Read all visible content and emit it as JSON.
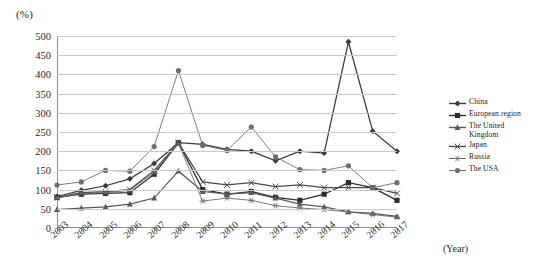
{
  "chart_data": {
    "type": "line",
    "title": "",
    "xlabel": "(Year)",
    "ylabel": "(%)",
    "ylim": [
      0,
      500
    ],
    "ytick_step": 50,
    "grid": true,
    "legend_position": "right",
    "categories": [
      "2003",
      "2004",
      "2005",
      "2006",
      "2007",
      "2008",
      "2009",
      "2010",
      "2011",
      "2012",
      "2013",
      "2014",
      "2015",
      "2016",
      "2017"
    ],
    "yticks": [
      "0",
      "50",
      "100",
      "150",
      "200",
      "250",
      "300",
      "350",
      "400",
      "450",
      "500"
    ],
    "series": [
      {
        "name": "China",
        "marker": "diamond",
        "color": "#3a3a3a",
        "values": [
          82,
          98,
          110,
          128,
          168,
          222,
          218,
          205,
          200,
          175,
          200,
          195,
          485,
          252,
          200
        ]
      },
      {
        "name": "European region",
        "marker": "square",
        "color": "#2e2e2e",
        "values": [
          80,
          88,
          90,
          92,
          140,
          222,
          100,
          88,
          95,
          80,
          72,
          88,
          118,
          105,
          72
        ]
      },
      {
        "name": "The United Kingdom",
        "marker": "triangle",
        "color": "#5a5a5a",
        "values": [
          48,
          52,
          55,
          62,
          78,
          148,
          95,
          88,
          92,
          78,
          62,
          55,
          42,
          38,
          30
        ]
      },
      {
        "name": "Japan",
        "marker": "line",
        "color": "#4a4a4a",
        "values": [
          80,
          92,
          95,
          100,
          150,
          222,
          120,
          112,
          118,
          108,
          112,
          105,
          105,
          105,
          90
        ]
      },
      {
        "name": "Russia",
        "marker": "asterisk",
        "color": "#6b6b6b",
        "values": [
          78,
          90,
          92,
          98,
          145,
          220,
          70,
          78,
          72,
          58,
          52,
          48,
          42,
          35,
          28
        ]
      },
      {
        "name": "The USA",
        "marker": "circle",
        "color": "#6f6f6f",
        "values": [
          112,
          120,
          150,
          148,
          212,
          410,
          215,
          202,
          263,
          185,
          152,
          150,
          162,
          105,
          118
        ]
      }
    ]
  }
}
